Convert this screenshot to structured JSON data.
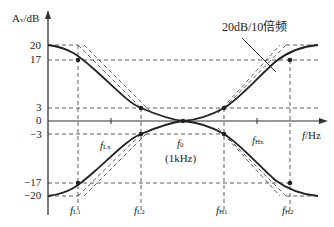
{
  "diagram": {
    "y_axis_label": "A",
    "y_axis_label_sub": "v",
    "y_axis_unit": "/dB",
    "x_axis_label": "f",
    "x_axis_unit": "/Hz",
    "y_ticks": [
      "20",
      "17",
      "3",
      "0",
      "−3",
      "−17",
      "−20"
    ],
    "annotation": "20dB/10倍频",
    "center_freq": {
      "label": "f",
      "sub": "0",
      "value": "(1kHz)"
    },
    "freq_labels": [
      {
        "label": "f",
        "sub": "L1"
      },
      {
        "label": "f",
        "sub": "L2"
      },
      {
        "label": "f",
        "sub": "H1"
      },
      {
        "label": "f",
        "sub": "H2"
      },
      {
        "label": "f",
        "sub": "Lx"
      },
      {
        "label": "f",
        "sub": "Hx"
      }
    ]
  }
}
